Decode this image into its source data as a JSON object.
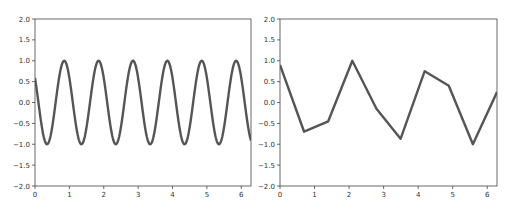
{
  "chart_data": [
    {
      "type": "line",
      "title": "",
      "xlabel": "",
      "ylabel": "",
      "xlim": [
        0,
        6.283
      ],
      "ylim": [
        -2.0,
        2.0
      ],
      "x_ticks": [
        "0",
        "1",
        "2",
        "3",
        "4",
        "5",
        "6"
      ],
      "y_ticks": [
        "-2.0",
        "-1.5",
        "-1.0",
        "-0.5",
        "0.0",
        "0.5",
        "1.0",
        "1.5",
        "2.0"
      ],
      "grid": false,
      "legend": null,
      "series": [
        {
          "name": "sine (period 1)",
          "function": "sin(2*pi*x + phase), peaks near x=0.85,1.85,...,5.85",
          "x": [
            0,
            0.35,
            0.85,
            1.35,
            1.85,
            2.35,
            2.85,
            3.35,
            3.85,
            4.35,
            4.85,
            5.35,
            5.85,
            6.283
          ],
          "values": [
            0.6,
            -1.0,
            1.0,
            -1.0,
            1.0,
            -1.0,
            1.0,
            -1.0,
            1.0,
            -1.0,
            1.0,
            -1.0,
            1.0,
            -0.85
          ]
        }
      ],
      "color": "#555555"
    },
    {
      "type": "line",
      "title": "",
      "xlabel": "",
      "ylabel": "",
      "xlim": [
        0,
        6.283
      ],
      "ylim": [
        -2.0,
        2.0
      ],
      "x_ticks": [
        "0",
        "1",
        "2",
        "3",
        "4",
        "5",
        "6"
      ],
      "y_ticks": [
        "-2.0",
        "-1.5",
        "-1.0",
        "-0.5",
        "0.0",
        "0.5",
        "1.0",
        "1.5",
        "2.0"
      ],
      "grid": false,
      "legend": null,
      "series": [
        {
          "name": "sampled",
          "x": [
            0,
            0.698,
            1.396,
            2.094,
            2.793,
            3.491,
            4.189,
            4.887,
            5.585,
            6.283
          ],
          "values": [
            0.9,
            -0.7,
            -0.45,
            1.0,
            -0.15,
            -0.87,
            0.75,
            0.4,
            -1.0,
            0.25
          ]
        }
      ],
      "color": "#555555"
    }
  ]
}
